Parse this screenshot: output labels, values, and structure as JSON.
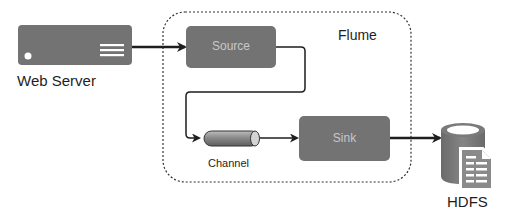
{
  "diagram": {
    "container": {
      "label": "Flume"
    },
    "nodes": {
      "web_server": {
        "label": "Web Server",
        "icon": "server-icon"
      },
      "source": {
        "label": "Source"
      },
      "channel": {
        "label": "Channel",
        "icon": "pipe-cylinder-icon"
      },
      "sink": {
        "label": "Sink"
      },
      "hdfs": {
        "label": "HDFS",
        "icon": "database-document-icon"
      }
    },
    "edges": [
      {
        "from": "Web Server",
        "to": "Source"
      },
      {
        "from": "Source",
        "to": "Channel"
      },
      {
        "from": "Channel",
        "to": "Sink"
      },
      {
        "from": "Sink",
        "to": "HDFS"
      }
    ],
    "colors": {
      "box_fill": "#737373",
      "box_text": "#c8c8c8",
      "line": "#1e1e1e",
      "container_border": "#333333"
    }
  }
}
